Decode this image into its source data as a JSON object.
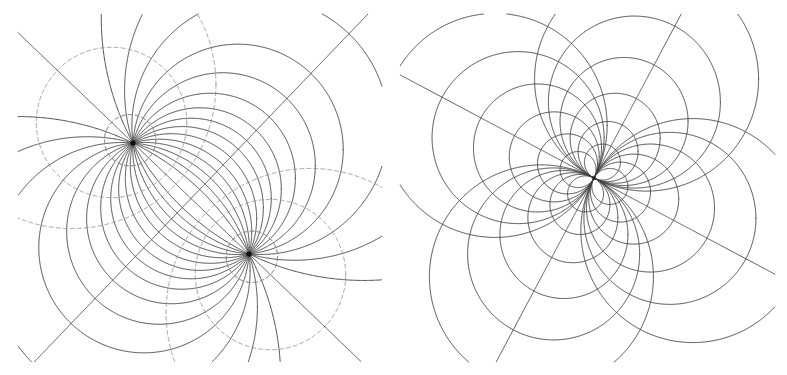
{
  "document": {
    "title": "Coaxial Circle Pencils",
    "background_color": "#ffffff",
    "width": 787,
    "height": 375,
    "panel_count": 2
  },
  "style": {
    "solid_stroke": "#3a3a3a",
    "dashed_stroke": "#8a8a8a",
    "line_stroke": "#4a4a4a",
    "node_fill": "#101010",
    "solid_width": 0.9,
    "dashed_width": 0.8,
    "line_width": 0.9,
    "dash_pattern": "4 3"
  },
  "panels": [
    {
      "id": "left-panel",
      "name": "elliptic-hyperbolic-pencil",
      "label": "Apollonian circles: intersecting pencil with orthogonal non-intersecting pencil",
      "pencil_type": "elliptic",
      "viewbox": [
        0,
        0,
        394,
        375
      ],
      "focal_points": [
        {
          "name": "point-A",
          "x": 133,
          "y": 143
        },
        {
          "name": "point-B",
          "x": 249,
          "y": 254
        }
      ],
      "midpoint": {
        "x": 191,
        "y": 198.5
      },
      "half_separation": 80.3,
      "axis_angle_deg": 43.8,
      "elliptic_family": {
        "description": "Solid circles passing through both focal points",
        "stroke": "#3a3a3a",
        "dashed": false,
        "offsets": [
          -250,
          -150,
          -100,
          -68,
          -46,
          -28,
          -13,
          0,
          13,
          28,
          46,
          68,
          100,
          150,
          250
        ]
      },
      "hyperbolic_family": {
        "description": "Dashed Apollonian circles orthogonal to the solid family",
        "stroke": "#8a8a8a",
        "dashed": true,
        "offsets": [
          -165,
          -110,
          -70,
          -42,
          42,
          70,
          110,
          165
        ]
      },
      "straight_lines": [
        {
          "name": "radical-axis",
          "through_midpoint": true,
          "angle_deg": 133.8
        },
        {
          "name": "line-of-centers",
          "through_midpoint": true,
          "angle_deg": 43.8
        }
      ]
    },
    {
      "id": "right-panel",
      "name": "parabolic-pencil",
      "label": "Two orthogonal parabolic pencils tangent at a common point",
      "pencil_type": "parabolic",
      "viewbox": [
        394,
        0,
        393,
        375
      ],
      "tangency_point": {
        "name": "tangent-node",
        "x": 594,
        "y": 178
      },
      "tangent_angle_deg": 28.0,
      "family_a": {
        "description": "Circles tangent along the primary axis",
        "stroke": "#3a3a3a",
        "dashed": false,
        "radii": [
          18,
          30,
          45,
          64,
          86,
          112
        ]
      },
      "family_b": {
        "description": "Orthogonal circles tangent along the perpendicular axis",
        "stroke": "#3a3a3a",
        "dashed": false,
        "radii": [
          18,
          30,
          45,
          64,
          86,
          112
        ]
      },
      "straight_lines": [
        {
          "name": "tangent-line",
          "angle_deg": 28.0
        },
        {
          "name": "normal-line",
          "angle_deg": 118.0
        }
      ]
    }
  ]
}
